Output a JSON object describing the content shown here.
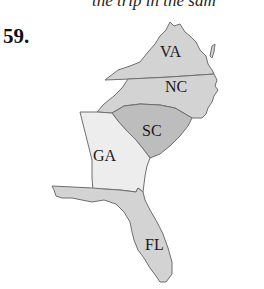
{
  "header": {
    "clipped_text": "the trip in the sam"
  },
  "problem": {
    "number": "59."
  },
  "map": {
    "states": [
      {
        "abbr": "VA",
        "fill": "#d3d3d3"
      },
      {
        "abbr": "NC",
        "fill": "#d3d3d3"
      },
      {
        "abbr": "SC",
        "fill": "#bdbdbd"
      },
      {
        "abbr": "GA",
        "fill": "#ededed"
      },
      {
        "abbr": "FL",
        "fill": "#d3d3d3"
      }
    ],
    "outline_color": "#6f6f6f"
  }
}
